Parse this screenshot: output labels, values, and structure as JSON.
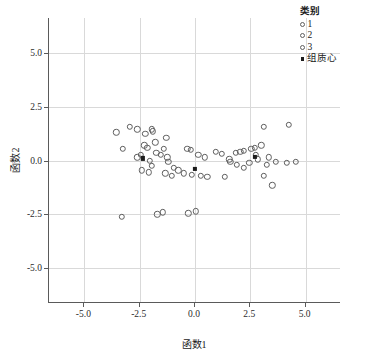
{
  "chart_data": {
    "type": "scatter",
    "title": "",
    "xlabel": "函数1",
    "ylabel": "函数2",
    "xlim": [
      -6.6,
      6.6
    ],
    "ylim": [
      -6.6,
      6.6
    ],
    "xticks": [
      "-5.0",
      "-2.5",
      "0.0",
      "2.5",
      "5.0"
    ],
    "xtick_values": [
      -5.0,
      -2.5,
      0.0,
      2.5,
      5.0
    ],
    "yticks": [
      "5.0",
      "2.5",
      "0.0",
      "-2.5",
      "-5.0"
    ],
    "ytick_values": [
      5.0,
      2.5,
      0.0,
      -2.5,
      -5.0
    ],
    "grid": true,
    "legend_position": "top-right",
    "legend_title": "类别",
    "legend_entries": [
      {
        "label": "1",
        "marker": "open-circle"
      },
      {
        "label": "2",
        "marker": "open-circle"
      },
      {
        "label": "3",
        "marker": "open-circle"
      },
      {
        "label": "组质心",
        "marker": "filled-square"
      }
    ],
    "series": [
      {
        "name": "1",
        "marker": "open-circle",
        "points": [
          [
            -3.55,
            1.3
          ],
          [
            -2.95,
            1.55
          ],
          [
            -3.25,
            0.55
          ],
          [
            -2.25,
            1.25
          ],
          [
            -1.95,
            1.45
          ],
          [
            -1.9,
            1.35
          ],
          [
            -2.3,
            0.7
          ],
          [
            -2.15,
            0.6
          ],
          [
            -1.8,
            0.85
          ],
          [
            -1.75,
            0.35
          ],
          [
            -1.55,
            0.25
          ],
          [
            -1.4,
            0.55
          ],
          [
            -2.45,
            0.25
          ],
          [
            -2.6,
            0.15
          ],
          [
            -2.05,
            0.0
          ],
          [
            -1.95,
            -0.25
          ],
          [
            -2.4,
            -0.45
          ],
          [
            -2.1,
            -0.55
          ],
          [
            -1.3,
            1.05
          ],
          [
            -1.25,
            0.15
          ],
          [
            -1.2,
            -0.05
          ],
          [
            -0.95,
            -0.35
          ],
          [
            -1.35,
            -0.6
          ],
          [
            -1.05,
            -0.7
          ],
          [
            -1.7,
            -2.5
          ],
          [
            -1.45,
            -2.4
          ],
          [
            -3.3,
            -2.6
          ],
          [
            -2.6,
            1.45
          ]
        ]
      },
      {
        "name": "2",
        "marker": "open-circle",
        "points": [
          [
            -0.35,
            0.55
          ],
          [
            -0.2,
            0.5
          ],
          [
            0.15,
            0.25
          ],
          [
            0.45,
            0.15
          ],
          [
            -0.5,
            -0.6
          ],
          [
            -0.15,
            -0.65
          ],
          [
            0.25,
            -0.7
          ],
          [
            0.55,
            -0.75
          ],
          [
            -0.3,
            -2.45
          ],
          [
            0.05,
            -2.35
          ],
          [
            0.95,
            0.4
          ],
          [
            1.2,
            0.3
          ],
          [
            1.55,
            0.05
          ],
          [
            -0.75,
            -0.45
          ]
        ]
      },
      {
        "name": "3",
        "marker": "open-circle",
        "points": [
          [
            1.85,
            0.35
          ],
          [
            2.05,
            0.4
          ],
          [
            2.2,
            0.45
          ],
          [
            2.55,
            0.55
          ],
          [
            2.7,
            0.6
          ],
          [
            2.75,
            0.25
          ],
          [
            3.0,
            0.7
          ],
          [
            3.1,
            1.55
          ],
          [
            1.6,
            -0.05
          ],
          [
            1.9,
            -0.2
          ],
          [
            2.2,
            -0.35
          ],
          [
            2.45,
            -0.1
          ],
          [
            3.25,
            -0.2
          ],
          [
            3.35,
            0.15
          ],
          [
            3.65,
            -0.05
          ],
          [
            4.15,
            -0.1
          ],
          [
            4.55,
            -0.05
          ],
          [
            3.1,
            -0.7
          ],
          [
            3.5,
            -1.15
          ],
          [
            1.35,
            -0.75
          ],
          [
            4.25,
            1.65
          ],
          [
            2.85,
            0.05
          ]
        ]
      },
      {
        "name": "组质心",
        "marker": "filled-square",
        "points": [
          [
            -2.35,
            0.1
          ],
          [
            0.0,
            -0.4
          ],
          [
            2.7,
            0.15
          ]
        ]
      }
    ]
  }
}
